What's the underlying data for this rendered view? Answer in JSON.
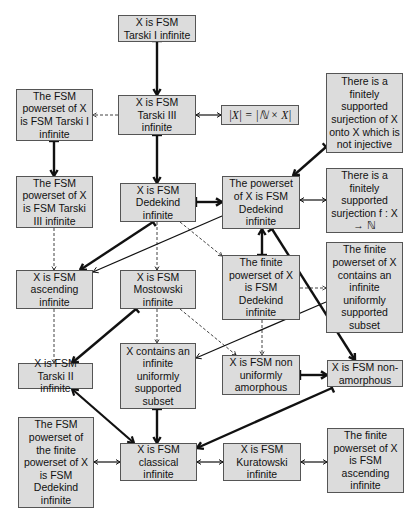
{
  "diagram": {
    "nodes": [
      {
        "id": "tarski1",
        "label": "X is FSM Tarski I infinite",
        "x": 118,
        "y": 15,
        "w": 78,
        "h": 27
      },
      {
        "id": "tarski3",
        "label": "X is FSM Tarski III infinite",
        "x": 118,
        "y": 95,
        "w": 78,
        "h": 40
      },
      {
        "id": "card",
        "label": "|X| = |ℕ × X|",
        "x": 221,
        "y": 105,
        "w": 78,
        "h": 20,
        "math": true
      },
      {
        "id": "surj_noninj",
        "label": "There is a finitely supported surjection of X onto X which is not injective",
        "x": 326,
        "y": 73,
        "w": 77,
        "h": 80
      },
      {
        "id": "pow_tarski1",
        "label": "The FSM powerset of X is FSM Tarski I infinite",
        "x": 16,
        "y": 89,
        "w": 77,
        "h": 52
      },
      {
        "id": "pow_tarski3",
        "label": "The FSM powerset of X is FSM Tarski III infinite",
        "x": 16,
        "y": 176,
        "w": 77,
        "h": 52
      },
      {
        "id": "dedekind",
        "label": "X is FSM Dedekind infinite",
        "x": 120,
        "y": 183,
        "w": 76,
        "h": 39
      },
      {
        "id": "pow_dedekind",
        "label": "The powerset of X is FSM Dedekind infinite",
        "x": 222,
        "y": 176,
        "w": 78,
        "h": 53
      },
      {
        "id": "surj_N",
        "label": "There is a finitely supported surjection f : X → ℕ",
        "x": 326,
        "y": 168,
        "w": 77,
        "h": 65
      },
      {
        "id": "ascending",
        "label": "X is FSM ascending infinite",
        "x": 16,
        "y": 270,
        "w": 77,
        "h": 39
      },
      {
        "id": "mostowski",
        "label": "X is FSM Mostowski infinite",
        "x": 120,
        "y": 270,
        "w": 76,
        "h": 39
      },
      {
        "id": "finpow_dedekind",
        "label": "The finite powerset of X is FSM Dedekind infinite",
        "x": 222,
        "y": 255,
        "w": 78,
        "h": 65
      },
      {
        "id": "finpow_uniform",
        "label": "The finite powerset of X contains an infinite uniformly supported subset",
        "x": 326,
        "y": 242,
        "w": 77,
        "h": 91
      },
      {
        "id": "tarski2",
        "label": "X is FSM Tarski II infinite",
        "x": 18,
        "y": 363,
        "w": 75,
        "h": 26
      },
      {
        "id": "uniform_subset",
        "label": "X contains an infinite uniformly supported subset",
        "x": 120,
        "y": 343,
        "w": 76,
        "h": 66
      },
      {
        "id": "non_unif_amorph",
        "label": "X is FSM non uniformly amorphous",
        "x": 222,
        "y": 355,
        "w": 78,
        "h": 40
      },
      {
        "id": "non_amorph",
        "label": "X is FSM non-amorphous",
        "x": 327,
        "y": 360,
        "w": 76,
        "h": 27
      },
      {
        "id": "pow_finpow_dedekind",
        "label": "The FSM powerset of the finite powerset of X is FSM Dedekind infinite",
        "x": 18,
        "y": 417,
        "w": 76,
        "h": 91
      },
      {
        "id": "classical",
        "label": "X is FSM classical infinite",
        "x": 120,
        "y": 443,
        "w": 77,
        "h": 38
      },
      {
        "id": "kuratowski",
        "label": "X is FSM Kuratowski infinite",
        "x": 223,
        "y": 443,
        "w": 78,
        "h": 38
      },
      {
        "id": "finpow_ascending",
        "label": "The finite powerset of X is FSM ascending infinite",
        "x": 327,
        "y": 428,
        "w": 77,
        "h": 65
      }
    ],
    "edges": [
      {
        "type": "strict",
        "x1": 157,
        "y1": 41,
        "x2": 157,
        "y2": 95
      },
      {
        "type": "strict",
        "x1": 157,
        "y1": 135,
        "x2": 157,
        "y2": 183
      },
      {
        "type": "strict",
        "x1": 54,
        "y1": 141,
        "x2": 54,
        "y2": 176
      },
      {
        "type": "equiv",
        "x1": 196,
        "y1": 115,
        "x2": 221,
        "y2": 115
      },
      {
        "type": "dashed",
        "x1": 118,
        "y1": 115,
        "x2": 93,
        "y2": 115
      },
      {
        "type": "strict",
        "x1": 196,
        "y1": 202,
        "x2": 222,
        "y2": 202
      },
      {
        "type": "equiv",
        "x1": 300,
        "y1": 200,
        "x2": 326,
        "y2": 200
      },
      {
        "type": "strict",
        "x1": 326,
        "y1": 147,
        "x2": 293,
        "y2": 176
      },
      {
        "type": "strict",
        "x1": 262,
        "y1": 255,
        "x2": 262,
        "y2": 229
      },
      {
        "type": "strict",
        "x1": 153,
        "y1": 222,
        "x2": 80,
        "y2": 270
      },
      {
        "type": "thin",
        "x1": 222,
        "y1": 216,
        "x2": 93,
        "y2": 272
      },
      {
        "type": "dashed",
        "x1": 54,
        "y1": 228,
        "x2": 54,
        "y2": 270
      },
      {
        "type": "dashed",
        "x1": 157,
        "y1": 222,
        "x2": 157,
        "y2": 270
      },
      {
        "type": "dashed",
        "x1": 180,
        "y1": 222,
        "x2": 222,
        "y2": 256
      },
      {
        "type": "dashed",
        "x1": 300,
        "y1": 288,
        "x2": 326,
        "y2": 288
      },
      {
        "type": "strict",
        "x1": 272,
        "y1": 229,
        "x2": 355,
        "y2": 360
      },
      {
        "type": "thin",
        "x1": 326,
        "y1": 302,
        "x2": 196,
        "y2": 358
      },
      {
        "type": "dashed",
        "x1": 262,
        "y1": 320,
        "x2": 262,
        "y2": 355
      },
      {
        "type": "dashed",
        "x1": 180,
        "y1": 309,
        "x2": 236,
        "y2": 355
      },
      {
        "type": "dashed",
        "x1": 157,
        "y1": 309,
        "x2": 157,
        "y2": 343
      },
      {
        "type": "strict",
        "x1": 136,
        "y1": 309,
        "x2": 72,
        "y2": 363
      },
      {
        "type": "dashed",
        "x1": 54,
        "y1": 309,
        "x2": 54,
        "y2": 363
      },
      {
        "type": "strict",
        "x1": 300,
        "y1": 375,
        "x2": 327,
        "y2": 375
      },
      {
        "type": "strict",
        "x1": 157,
        "y1": 409,
        "x2": 157,
        "y2": 443
      },
      {
        "type": "equiv2",
        "x1": 72,
        "y1": 389,
        "x2": 134,
        "y2": 443
      },
      {
        "type": "strict",
        "x1": 332,
        "y1": 388,
        "x2": 197,
        "y2": 448
      },
      {
        "type": "equiv",
        "x1": 94,
        "y1": 462,
        "x2": 120,
        "y2": 462
      },
      {
        "type": "equiv",
        "x1": 197,
        "y1": 462,
        "x2": 223,
        "y2": 462
      },
      {
        "type": "equiv",
        "x1": 301,
        "y1": 462,
        "x2": 327,
        "y2": 462
      }
    ]
  },
  "colors": {
    "box_fill": "#dcdcdc",
    "box_border": "#555555",
    "edge": "#111111"
  }
}
